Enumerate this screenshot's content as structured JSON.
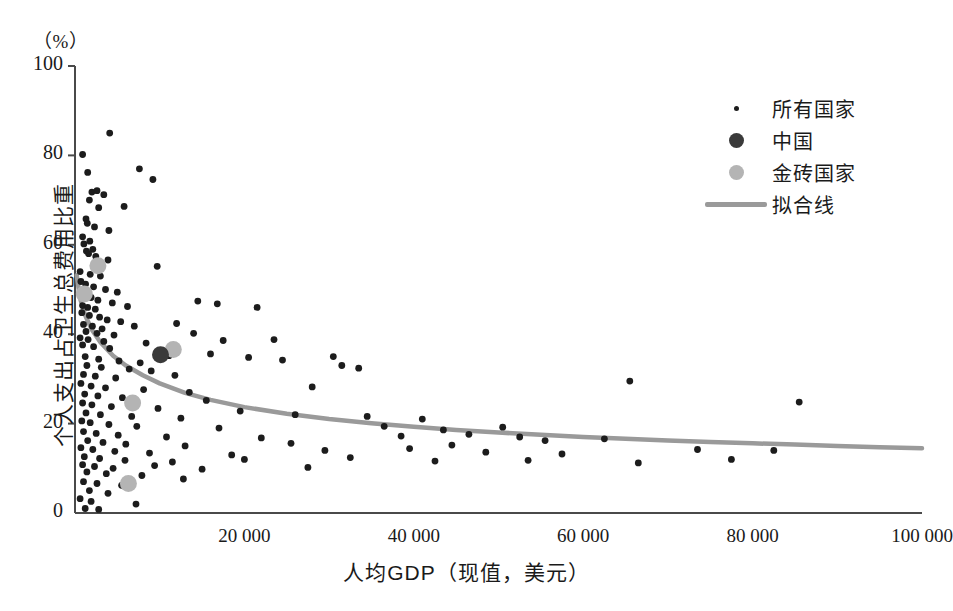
{
  "axes": {
    "unit_label": "（%）",
    "ylabel": "个人支出占卫生总费用比重",
    "xlabel": "人均GDP（现值，美元）",
    "yticks": [
      "0",
      "20",
      "40",
      "60",
      "80",
      "100"
    ],
    "xticks": [
      "20 000",
      "40 000",
      "60 000",
      "80 000",
      "100 000"
    ]
  },
  "legend": {
    "items": [
      {
        "label": "所有国家",
        "key": "small-dot"
      },
      {
        "label": "中国",
        "key": "china-dot"
      },
      {
        "label": "金砖国家",
        "key": "brics-dot"
      },
      {
        "label": "拟合线",
        "key": "fit-line"
      }
    ]
  },
  "caption": {
    "text": ""
  },
  "colors": {
    "all_countries": "#1c1c1c",
    "china": "#3a3a3a",
    "brics": "#b4b4b4",
    "fit_line": "#9a9a9a",
    "axis": "#4a4a4a"
  },
  "chart_data": {
    "type": "scatter",
    "title": "",
    "xlabel": "人均GDP（现值，美元）",
    "ylabel": "个人支出占卫生总费用比重",
    "unit": "%",
    "xlim": [
      0,
      100000
    ],
    "ylim": [
      0,
      100
    ],
    "xticks": [
      20000,
      40000,
      60000,
      80000,
      100000
    ],
    "yticks": [
      0,
      20,
      40,
      60,
      80,
      100
    ],
    "grid": false,
    "legend_position": "top-right",
    "series": [
      {
        "name": "所有国家",
        "marker": "small-dot",
        "color": "#1c1c1c",
        "points": [
          [
            900,
            80.2
          ],
          [
            4100,
            85.0
          ],
          [
            1500,
            76.2
          ],
          [
            7600,
            77.0
          ],
          [
            9200,
            74.6
          ],
          [
            2000,
            71.8
          ],
          [
            2600,
            72.1
          ],
          [
            3400,
            71.2
          ],
          [
            1700,
            70.0
          ],
          [
            2800,
            68.3
          ],
          [
            5800,
            68.6
          ],
          [
            1300,
            65.8
          ],
          [
            1450,
            64.8
          ],
          [
            2300,
            64.0
          ],
          [
            4000,
            63.2
          ],
          [
            900,
            61.8
          ],
          [
            1050,
            60.2
          ],
          [
            1750,
            60.8
          ],
          [
            2100,
            59.0
          ],
          [
            1350,
            58.6
          ],
          [
            1600,
            58.0
          ],
          [
            2450,
            57.4
          ],
          [
            3900,
            56.6
          ],
          [
            9700,
            55.2
          ],
          [
            600,
            54.0
          ],
          [
            1800,
            53.4
          ],
          [
            3000,
            53.0
          ],
          [
            700,
            51.8
          ],
          [
            1250,
            51.2
          ],
          [
            2200,
            50.6
          ],
          [
            3600,
            50.0
          ],
          [
            5000,
            49.4
          ],
          [
            1100,
            48.8
          ],
          [
            1900,
            48.2
          ],
          [
            2700,
            47.6
          ],
          [
            4400,
            47.0
          ],
          [
            900,
            46.4
          ],
          [
            1500,
            46.0
          ],
          [
            2400,
            45.6
          ],
          [
            6200,
            46.2
          ],
          [
            14500,
            47.4
          ],
          [
            16800,
            46.8
          ],
          [
            21500,
            46.0
          ],
          [
            800,
            44.8
          ],
          [
            1700,
            44.2
          ],
          [
            2900,
            43.8
          ],
          [
            3800,
            43.2
          ],
          [
            5400,
            42.8
          ],
          [
            1000,
            42.2
          ],
          [
            2050,
            41.8
          ],
          [
            3200,
            41.2
          ],
          [
            7000,
            41.8
          ],
          [
            12000,
            42.4
          ],
          [
            1300,
            40.6
          ],
          [
            2600,
            40.2
          ],
          [
            4600,
            39.8
          ],
          [
            600,
            39.2
          ],
          [
            1550,
            38.8
          ],
          [
            3400,
            38.4
          ],
          [
            8400,
            38.0
          ],
          [
            14000,
            40.2
          ],
          [
            17500,
            38.6
          ],
          [
            23500,
            38.8
          ],
          [
            900,
            37.6
          ],
          [
            2200,
            37.2
          ],
          [
            4100,
            36.8
          ],
          [
            10300,
            36.4
          ],
          [
            11100,
            35.2
          ],
          [
            16000,
            35.6
          ],
          [
            20500,
            34.8
          ],
          [
            1200,
            35.0
          ],
          [
            2800,
            34.4
          ],
          [
            5200,
            34.0
          ],
          [
            7700,
            33.6
          ],
          [
            1400,
            33.0
          ],
          [
            3100,
            32.6
          ],
          [
            6400,
            32.2
          ],
          [
            9000,
            31.8
          ],
          [
            24500,
            34.2
          ],
          [
            30500,
            35.0
          ],
          [
            31500,
            33.0
          ],
          [
            33500,
            32.4
          ],
          [
            1000,
            31.0
          ],
          [
            2400,
            30.6
          ],
          [
            4800,
            30.2
          ],
          [
            11800,
            30.8
          ],
          [
            65500,
            29.5
          ],
          [
            85500,
            24.8
          ],
          [
            700,
            29.0
          ],
          [
            1900,
            28.4
          ],
          [
            3600,
            28.0
          ],
          [
            8100,
            27.6
          ],
          [
            13500,
            27.0
          ],
          [
            28000,
            28.2
          ],
          [
            1150,
            26.6
          ],
          [
            2700,
            26.2
          ],
          [
            5600,
            25.8
          ],
          [
            15500,
            25.2
          ],
          [
            900,
            24.6
          ],
          [
            2000,
            24.2
          ],
          [
            4300,
            23.8
          ],
          [
            9800,
            23.4
          ],
          [
            19500,
            22.8
          ],
          [
            26000,
            22.0
          ],
          [
            1300,
            22.4
          ],
          [
            3000,
            22.0
          ],
          [
            6700,
            21.6
          ],
          [
            12500,
            21.2
          ],
          [
            34500,
            21.6
          ],
          [
            41000,
            21.0
          ],
          [
            800,
            20.6
          ],
          [
            1800,
            20.2
          ],
          [
            4000,
            19.8
          ],
          [
            7300,
            19.4
          ],
          [
            17000,
            19.0
          ],
          [
            36500,
            19.4
          ],
          [
            43500,
            18.6
          ],
          [
            50500,
            19.2
          ],
          [
            1000,
            18.2
          ],
          [
            2500,
            17.8
          ],
          [
            5100,
            17.4
          ],
          [
            10800,
            17.0
          ],
          [
            22000,
            16.8
          ],
          [
            38500,
            17.2
          ],
          [
            46500,
            17.6
          ],
          [
            52500,
            17.0
          ],
          [
            1500,
            16.2
          ],
          [
            3300,
            15.8
          ],
          [
            6000,
            15.4
          ],
          [
            13000,
            15.0
          ],
          [
            25500,
            15.6
          ],
          [
            44500,
            15.2
          ],
          [
            55500,
            16.2
          ],
          [
            62500,
            16.6
          ],
          [
            700,
            14.6
          ],
          [
            2100,
            14.2
          ],
          [
            4700,
            13.8
          ],
          [
            8800,
            13.4
          ],
          [
            18500,
            13.0
          ],
          [
            29500,
            14.0
          ],
          [
            39500,
            14.4
          ],
          [
            48500,
            13.6
          ],
          [
            57500,
            13.2
          ],
          [
            73500,
            14.2
          ],
          [
            82500,
            14.0
          ],
          [
            1100,
            12.6
          ],
          [
            2900,
            12.2
          ],
          [
            5900,
            11.8
          ],
          [
            11500,
            11.4
          ],
          [
            20000,
            12.0
          ],
          [
            32500,
            12.4
          ],
          [
            42500,
            11.6
          ],
          [
            53500,
            11.8
          ],
          [
            66500,
            11.2
          ],
          [
            77500,
            12.0
          ],
          [
            900,
            10.8
          ],
          [
            2300,
            10.4
          ],
          [
            4500,
            10.0
          ],
          [
            9400,
            10.6
          ],
          [
            15000,
            9.8
          ],
          [
            27500,
            10.2
          ],
          [
            1400,
            9.2
          ],
          [
            3700,
            8.8
          ],
          [
            7900,
            8.4
          ],
          [
            12800,
            7.6
          ],
          [
            1000,
            7.0
          ],
          [
            2600,
            6.6
          ],
          [
            5500,
            6.2
          ],
          [
            1700,
            5.0
          ],
          [
            3900,
            4.4
          ],
          [
            600,
            3.2
          ],
          [
            1900,
            2.6
          ],
          [
            7200,
            2.0
          ],
          [
            1200,
            1.0
          ],
          [
            2800,
            0.8
          ]
        ]
      },
      {
        "name": "中国",
        "marker": "large-dot",
        "color": "#3a3a3a",
        "points": [
          [
            10100,
            35.4
          ]
        ]
      },
      {
        "name": "金砖国家",
        "marker": "large-dot",
        "color": "#b4b4b4",
        "points": [
          [
            2700,
            55.3
          ],
          [
            1100,
            49.0
          ],
          [
            11600,
            36.6
          ],
          [
            6800,
            24.6
          ],
          [
            6300,
            6.6
          ]
        ]
      }
    ],
    "fit_line": {
      "name": "拟合线",
      "color": "#9a9a9a",
      "points": [
        [
          200,
          53.2
        ],
        [
          600,
          48.0
        ],
        [
          1200,
          44.2
        ],
        [
          2000,
          41.0
        ],
        [
          3000,
          38.2
        ],
        [
          4500,
          35.2
        ],
        [
          6000,
          33.0
        ],
        [
          8000,
          30.8
        ],
        [
          10000,
          29.0
        ],
        [
          13000,
          26.9
        ],
        [
          16000,
          25.3
        ],
        [
          20000,
          23.7
        ],
        [
          25000,
          22.2
        ],
        [
          30000,
          21.0
        ],
        [
          35000,
          20.1
        ],
        [
          40000,
          19.3
        ],
        [
          45000,
          18.6
        ],
        [
          50000,
          18.0
        ],
        [
          55000,
          17.5
        ],
        [
          60000,
          17.0
        ],
        [
          65000,
          16.6
        ],
        [
          70000,
          16.2
        ],
        [
          75000,
          15.9
        ],
        [
          80000,
          15.6
        ],
        [
          85000,
          15.3
        ],
        [
          90000,
          15.0
        ],
        [
          95000,
          14.7
        ],
        [
          100000,
          14.5
        ]
      ]
    }
  }
}
